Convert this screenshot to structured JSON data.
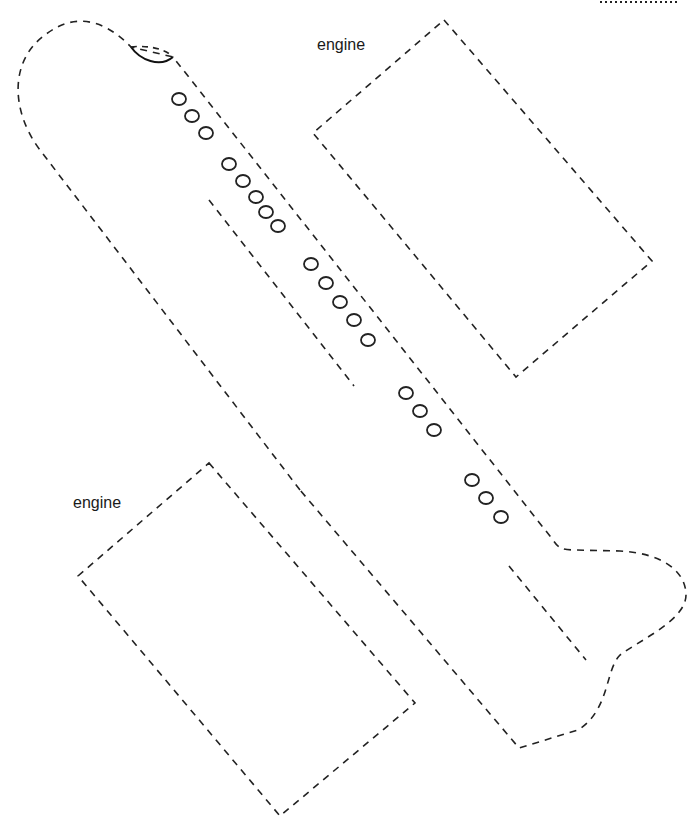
{
  "labels": {
    "engine_top": "engine",
    "engine_bottom": "engine"
  },
  "colors": {
    "line": "#222222",
    "background": "#ffffff"
  },
  "cut_line_style": "dashed",
  "windows": {
    "group_1_count": 3,
    "group_2_count": 5,
    "group_3_count": 5,
    "group_4_count": 3,
    "group_5_count": 3
  }
}
